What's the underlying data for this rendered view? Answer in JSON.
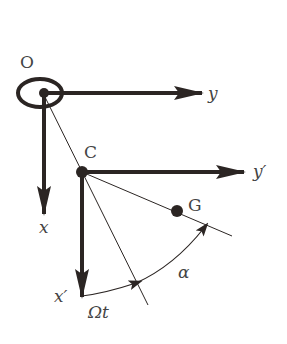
{
  "diagram": {
    "title": "",
    "colors": {
      "background": "#ffffff",
      "ink": "#2b2523",
      "label": "#444444"
    },
    "labels": {
      "origin": "O",
      "y_axis": "y",
      "x_axis": "x",
      "point_c": "C",
      "y_prime_axis": "y′",
      "x_prime_axis": "x′",
      "point_g": "G",
      "omega_t": "Ωt",
      "alpha": "α"
    },
    "nodes": [
      {
        "id": "O",
        "label": "O",
        "shape": "ellipse-with-dot",
        "x": 43,
        "y": 93
      },
      {
        "id": "C",
        "label": "C",
        "shape": "dot",
        "x": 82,
        "y": 172
      },
      {
        "id": "G",
        "label": "G",
        "shape": "dot",
        "x": 177,
        "y": 211
      }
    ],
    "edges": [
      {
        "from": "O",
        "to": "y",
        "type": "thick-arrow"
      },
      {
        "from": "O",
        "to": "x",
        "type": "thick-arrow"
      },
      {
        "from": "C",
        "to": "y′",
        "type": "thick-arrow"
      },
      {
        "from": "C",
        "to": "x′",
        "type": "thick-arrow"
      },
      {
        "from": "O",
        "to": "C",
        "type": "thin-line",
        "note": "line through O and C extended"
      },
      {
        "from": "C",
        "to": "G",
        "type": "thin-line",
        "note": "line through C and G extended"
      },
      {
        "from": "x′",
        "to": "OC-line",
        "type": "arc-arrow",
        "label": "Ωt"
      },
      {
        "from": "OC-line",
        "to": "CG-line",
        "type": "arc-arrow",
        "label": "α"
      }
    ]
  }
}
